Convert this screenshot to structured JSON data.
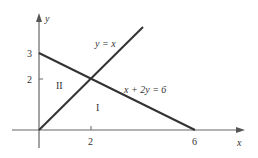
{
  "diagram": {
    "type": "coordinate-graph",
    "axes": {
      "x_label": "x",
      "y_label": "y",
      "x_ticks": [
        {
          "value": 2,
          "label": "2"
        },
        {
          "value": 6,
          "label": "6"
        }
      ],
      "y_ticks": [
        {
          "value": 2,
          "label": "2"
        },
        {
          "value": 3,
          "label": "3"
        }
      ]
    },
    "lines": [
      {
        "equation": "y = x",
        "label": "y = x",
        "from": [
          0,
          0
        ],
        "to": [
          4,
          4
        ]
      },
      {
        "equation": "x + 2y = 6",
        "label": "x + 2y = 6",
        "from": [
          0,
          3
        ],
        "to": [
          6,
          0
        ]
      }
    ],
    "intersection": [
      2,
      2
    ],
    "regions": [
      {
        "label": "I",
        "description": "below both lines, above x-axis"
      },
      {
        "label": "II",
        "description": "between y-axis, y = x and x + 2y = 6"
      }
    ],
    "colors": {
      "axis": "#555555",
      "line": "#333333",
      "text": "#333333"
    }
  }
}
